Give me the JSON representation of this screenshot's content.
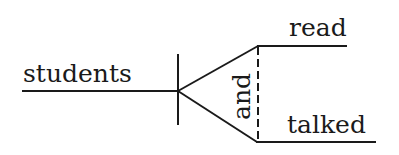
{
  "diagram": {
    "type": "sentence-diagram",
    "subject": "students",
    "conjunction": "and",
    "predicates": [
      "read",
      "talked"
    ],
    "colors": {
      "ink": "#1a1a1a",
      "background": "#ffffff"
    }
  }
}
